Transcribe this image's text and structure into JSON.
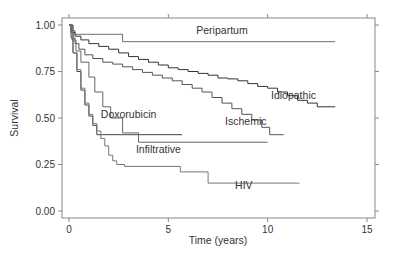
{
  "chart_data": {
    "type": "line",
    "title": "",
    "xlabel": "Time (years)",
    "ylabel": "Survival",
    "xlim": [
      0,
      15
    ],
    "ylim": [
      0,
      1
    ],
    "xticks": [
      0,
      5,
      10,
      15
    ],
    "xtick_labels": [
      "0",
      "5",
      "10",
      "15"
    ],
    "yticks": [
      0,
      0.25,
      0.5,
      0.75,
      1.0
    ],
    "ytick_labels": [
      "0.00",
      "0.25",
      "0.50",
      "0.75",
      "1.00"
    ],
    "grid": false,
    "legend": "none (direct labels)",
    "step": true,
    "series": [
      {
        "name": "Peripartum",
        "color": "#6e6e6e",
        "label_at": [
          7.7,
          0.95
        ],
        "x": [
          0,
          0.15,
          0.3,
          2.7,
          13.4
        ],
        "y": [
          1.0,
          0.97,
          0.95,
          0.91,
          0.91
        ]
      },
      {
        "name": "Idiopathic",
        "color": "#333333",
        "label_at": [
          11.3,
          0.6
        ],
        "x": [
          0,
          0.1,
          0.3,
          0.6,
          1.0,
          1.5,
          2.0,
          2.5,
          3.0,
          3.5,
          4.0,
          4.5,
          5.0,
          5.5,
          6.0,
          6.5,
          7.0,
          7.5,
          8.0,
          8.5,
          9.0,
          9.5,
          10.0,
          10.5,
          11.0,
          11.5,
          12.0,
          12.5,
          13.4
        ],
        "y": [
          1.0,
          0.96,
          0.94,
          0.92,
          0.9,
          0.885,
          0.87,
          0.85,
          0.83,
          0.815,
          0.8,
          0.785,
          0.77,
          0.76,
          0.75,
          0.74,
          0.73,
          0.715,
          0.71,
          0.7,
          0.685,
          0.67,
          0.66,
          0.64,
          0.62,
          0.595,
          0.58,
          0.56,
          0.56
        ]
      },
      {
        "name": "Ischemic",
        "color": "#555555",
        "label_at": [
          8.9,
          0.46
        ],
        "x": [
          0,
          0.1,
          0.3,
          0.5,
          0.8,
          1.2,
          1.7,
          2.2,
          2.7,
          3.2,
          3.7,
          4.2,
          4.7,
          5.2,
          5.7,
          6.2,
          6.7,
          7.2,
          7.7,
          8.2,
          8.7,
          9.2,
          9.7,
          10.1,
          10.8
        ],
        "y": [
          1.0,
          0.93,
          0.9,
          0.87,
          0.84,
          0.82,
          0.8,
          0.79,
          0.775,
          0.76,
          0.745,
          0.73,
          0.715,
          0.7,
          0.68,
          0.66,
          0.64,
          0.61,
          0.58,
          0.55,
          0.52,
          0.49,
          0.45,
          0.41,
          0.41
        ]
      },
      {
        "name": "Doxorubicin",
        "color": "#444444",
        "label_at": [
          3.0,
          0.5
        ],
        "x": [
          0,
          0.2,
          0.4,
          0.6,
          0.8,
          1.0,
          1.2,
          1.4,
          5.7
        ],
        "y": [
          1.0,
          0.85,
          0.75,
          0.65,
          0.57,
          0.51,
          0.46,
          0.41,
          0.41
        ]
      },
      {
        "name": "Infiltrative",
        "color": "#666666",
        "label_at": [
          4.5,
          0.31
        ],
        "x": [
          0,
          0.15,
          0.35,
          0.6,
          1.0,
          1.3,
          1.7,
          2.1,
          2.7,
          3.5,
          10.0
        ],
        "y": [
          1.0,
          0.92,
          0.86,
          0.8,
          0.72,
          0.64,
          0.56,
          0.5,
          0.42,
          0.37,
          0.37
        ]
      },
      {
        "name": "HIV",
        "color": "#777777",
        "label_at": [
          8.8,
          0.12
        ],
        "x": [
          0,
          0.2,
          0.4,
          0.6,
          0.8,
          1.0,
          1.2,
          1.4,
          1.6,
          1.8,
          2.0,
          2.2,
          2.4,
          2.8,
          5.6,
          7.0,
          11.6
        ],
        "y": [
          1.0,
          0.85,
          0.76,
          0.66,
          0.58,
          0.52,
          0.47,
          0.43,
          0.39,
          0.35,
          0.3,
          0.27,
          0.25,
          0.24,
          0.21,
          0.15,
          0.15
        ]
      }
    ]
  }
}
